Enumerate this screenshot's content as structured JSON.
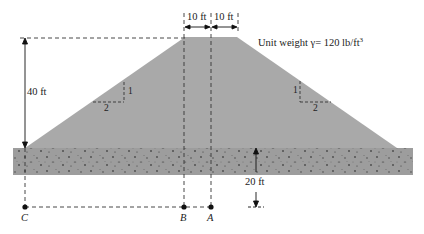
{
  "figure": {
    "colors": {
      "embankment_fill": "#a9a9a9",
      "soil_fill": "#9c9c9c",
      "soil_speckle": "#4a4a4a",
      "line": "#222222"
    },
    "labels": {
      "top_width_left": "10 ft",
      "top_width_right": "10 ft",
      "height": "40 ft",
      "unit_weight_prefix": "Unit weight γ= 120 lb/ft",
      "unit_weight_exp": "3",
      "slope_left_vertical": "1",
      "slope_left_horizontal": "2",
      "slope_right_vertical": "1",
      "slope_right_horizontal": "2",
      "depth": "20 ft",
      "point_c": "C",
      "point_b": "B",
      "point_a": "A"
    },
    "dimensions": {
      "crest_half_width_ft": 10,
      "embankment_height_ft": 40,
      "side_slope": "2H:1V",
      "unit_weight_lb_per_ft3": 120,
      "depth_to_points_ft": 20,
      "points": [
        "C",
        "B",
        "A"
      ]
    }
  }
}
